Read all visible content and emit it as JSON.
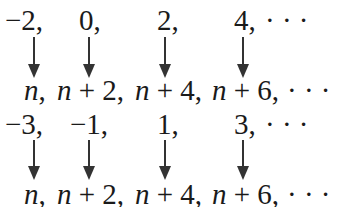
{
  "blocks": [
    {
      "id": "even",
      "top": 0,
      "top_terms": [
        {
          "text": "−2,",
          "left": 5
        },
        {
          "text": "0,",
          "left": 79
        },
        {
          "text": "2,",
          "left": 157
        },
        {
          "text": "4,",
          "left": 234
        },
        {
          "text": "· · ·",
          "left": 265
        }
      ],
      "arrow_x": [
        34,
        89,
        165,
        243
      ],
      "arrow_top": 37,
      "arrow_height": 41,
      "bottom_terms": [
        {
          "var": "n",
          "rest": ",",
          "left": 24
        },
        {
          "var": "n",
          "rest": " + 2,",
          "left": 57
        },
        {
          "var": "n",
          "rest": " + 4,",
          "left": 135
        },
        {
          "var": "n",
          "rest": " + 6,",
          "left": 212
        },
        {
          "var": "",
          "rest": "· · ·",
          "left": 287
        }
      ]
    },
    {
      "id": "odd",
      "top": 104,
      "top_terms": [
        {
          "text": "−3,",
          "left": 5
        },
        {
          "text": "−1,",
          "left": 70
        },
        {
          "text": "1,",
          "left": 157
        },
        {
          "text": "3,",
          "left": 234
        },
        {
          "text": "· · ·",
          "left": 265
        }
      ],
      "arrow_x": [
        34,
        89,
        165,
        243
      ],
      "arrow_top": 36,
      "arrow_height": 40,
      "bottom_terms": [
        {
          "var": "n",
          "rest": ",",
          "left": 24
        },
        {
          "var": "n",
          "rest": " + 2,",
          "left": 57
        },
        {
          "var": "n",
          "rest": " + 4,",
          "left": 135
        },
        {
          "var": "n",
          "rest": " + 6,",
          "left": 212
        },
        {
          "var": "",
          "rest": "· · ·",
          "left": 287
        }
      ]
    }
  ],
  "layout": {
    "top_row_y": 6,
    "bottom_row_y": 76
  },
  "colors": {
    "text": "#1a1a1a",
    "arrow": "#333333",
    "background": "#ffffff"
  }
}
